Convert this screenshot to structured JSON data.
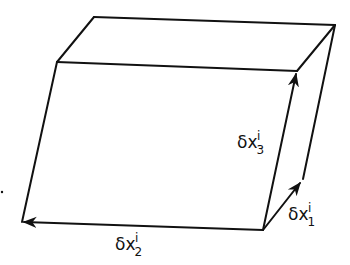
{
  "diagram": {
    "type": "parallelepiped",
    "stroke_color": "#111111",
    "background": "#ffffff",
    "vertices": {
      "front_top_left": [
        57,
        62
      ],
      "front_top_right": [
        297,
        71
      ],
      "front_bottom_left": [
        22,
        222
      ],
      "front_bottom_right": [
        263,
        230
      ],
      "back_top_left": [
        94,
        17
      ],
      "back_top_right": [
        335,
        25
      ],
      "back_bottom_right": [
        303,
        179
      ]
    },
    "vectors": [
      {
        "name": "delta-x-1",
        "from": [
          263,
          230
        ],
        "to": [
          303,
          179
        ],
        "label": {
          "symbol": "δx",
          "subscript": "1",
          "superscript": "i"
        }
      },
      {
        "name": "delta-x-2",
        "from": [
          263,
          230
        ],
        "to": [
          22,
          222
        ],
        "label": {
          "symbol": "δx",
          "subscript": "2",
          "superscript": "i"
        }
      },
      {
        "name": "delta-x-3",
        "from": [
          263,
          230
        ],
        "to": [
          297,
          71
        ],
        "label": {
          "symbol": "δx",
          "subscript": "3",
          "superscript": "i"
        }
      }
    ]
  }
}
